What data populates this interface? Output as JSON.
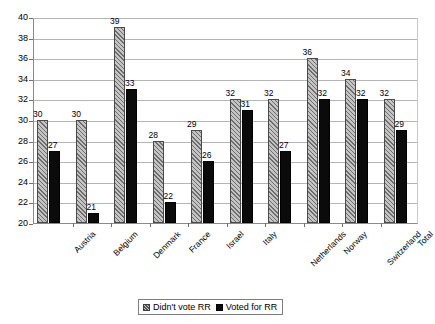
{
  "chart_data": {
    "type": "bar",
    "title": "",
    "subtitle": "",
    "xlabel": "",
    "ylabel": "",
    "ylim": [
      20,
      40
    ],
    "ytick_step": 2,
    "yticks": [
      20,
      22,
      24,
      26,
      28,
      30,
      32,
      34,
      36,
      38,
      40
    ],
    "grid": true,
    "legend_position": "bottom",
    "categories": [
      "Austria",
      "Belgium",
      "Denmark",
      "France",
      "Israel",
      "Italy",
      "Netherlands",
      "Norway",
      "Switzerland",
      "Total"
    ],
    "series": [
      {
        "name": "Didn't vote RR",
        "color": "#9a9a9a",
        "pattern": "diagonal-hatch",
        "values": [
          30,
          30,
          39,
          28,
          29,
          32,
          32,
          36,
          34,
          32
        ]
      },
      {
        "name": "Voted for RR",
        "color": "#0b0b0b",
        "pattern": "solid",
        "values": [
          27,
          21,
          33,
          22,
          26,
          31,
          27,
          32,
          32,
          29
        ]
      }
    ]
  },
  "legend": {
    "items": [
      {
        "label": "Didn't vote RR"
      },
      {
        "label": "Voted for RR"
      }
    ]
  }
}
